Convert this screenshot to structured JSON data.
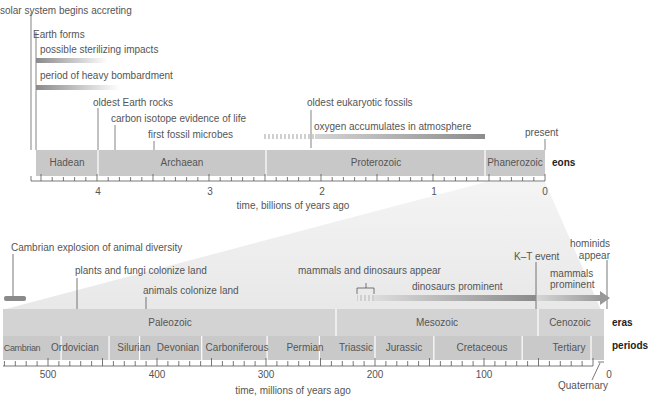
{
  "eons_chart": {
    "axis_label": "time, billions of years ago",
    "row_label": "eons",
    "ticks": [
      {
        "value": 4,
        "label": "4"
      },
      {
        "value": 3,
        "label": "3"
      },
      {
        "value": 2,
        "label": "2"
      },
      {
        "value": 1,
        "label": "1"
      },
      {
        "value": 0,
        "label": "0"
      }
    ],
    "eons": [
      {
        "name": "Hadean",
        "start": 4.6,
        "end": 4.0
      },
      {
        "name": "Archaean",
        "start": 4.0,
        "end": 2.5
      },
      {
        "name": "Proterozoic",
        "start": 2.5,
        "end": 0.542
      },
      {
        "name": "Phanerozoic",
        "start": 0.542,
        "end": 0
      }
    ],
    "events": [
      {
        "label": "solar system begins accreting"
      },
      {
        "label": "Earth forms"
      },
      {
        "label": "possible sterilizing impacts"
      },
      {
        "label": "period of heavy bombardment"
      },
      {
        "label": "oldest Earth rocks"
      },
      {
        "label": "carbon isotope evidence of life"
      },
      {
        "label": "first fossil microbes"
      },
      {
        "label": "oldest eukaryotic fossils"
      },
      {
        "label": "oxygen accumulates in atmosphere"
      },
      {
        "label": "present"
      }
    ]
  },
  "phanerozoic_chart": {
    "axis_label": "time, millions of years ago",
    "eras_label": "eras",
    "periods_label": "periods",
    "ticks": [
      {
        "value": 500,
        "label": "500"
      },
      {
        "value": 400,
        "label": "400"
      },
      {
        "value": 300,
        "label": "300"
      },
      {
        "value": 200,
        "label": "200"
      },
      {
        "value": 100,
        "label": "100"
      },
      {
        "value": 0,
        "label": "0"
      }
    ],
    "eras": [
      {
        "name": "Paleozoic",
        "start": 542,
        "end": 251
      },
      {
        "name": "Mesozoic",
        "start": 251,
        "end": 65
      },
      {
        "name": "Cenozoic",
        "start": 65,
        "end": 0
      }
    ],
    "periods": [
      {
        "name": "Cambrian",
        "start": 542,
        "end": 488
      },
      {
        "name": "Ordovician",
        "start": 488,
        "end": 444
      },
      {
        "name": "Silurian",
        "start": 444,
        "end": 416
      },
      {
        "name": "Devonian",
        "start": 416,
        "end": 359
      },
      {
        "name": "Carboniferous",
        "start": 359,
        "end": 299
      },
      {
        "name": "Permian",
        "start": 299,
        "end": 251
      },
      {
        "name": "Triassic",
        "start": 251,
        "end": 200
      },
      {
        "name": "Jurassic",
        "start": 200,
        "end": 146
      },
      {
        "name": "Cretaceous",
        "start": 146,
        "end": 65
      },
      {
        "name": "Tertiary",
        "start": 65,
        "end": 1.8
      }
    ],
    "quaternary_label": "Quaternary",
    "events": [
      {
        "label": "Cambrian explosion of animal diversity"
      },
      {
        "label": "plants and fungi colonize land"
      },
      {
        "label": "animals colonize land"
      },
      {
        "label": "mammals and dinosaurs appear"
      },
      {
        "label": "dinosaurs prominent"
      },
      {
        "label": "K–T event"
      },
      {
        "label": "mammals prominent"
      },
      {
        "label": "hominids appear"
      }
    ]
  },
  "colors": {
    "bar_fill": "#c8c8c8",
    "period_fill": "#cdcdcd",
    "fan_fill": "#ececec",
    "line": "#555555",
    "gradient_dark": "#8a8a8a"
  }
}
